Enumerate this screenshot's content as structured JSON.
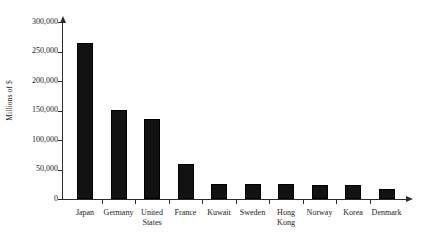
{
  "chart_data": {
    "type": "bar",
    "title": "",
    "xlabel": "",
    "ylabel": "Millions of $",
    "categories": [
      "Japan",
      "Germany",
      "United States",
      "France",
      "Kuwait",
      "Sweden",
      "Hong Kong",
      "Norway",
      "Korea",
      "Denmark"
    ],
    "values": [
      265000,
      151000,
      136000,
      60000,
      25000,
      25000,
      25000,
      24000,
      24000,
      17000
    ],
    "ylim": [
      0,
      300000
    ],
    "yticks": [
      0,
      50000,
      100000,
      150000,
      200000,
      250000,
      300000
    ],
    "ytick_labels": [
      "0",
      "50,000",
      "100,000",
      "150,000",
      "200,000",
      "250,000",
      "300,000"
    ],
    "grid": false,
    "legend": false,
    "bar_color": "#121212",
    "axis_color": "#2b2b2b"
  },
  "caption": ""
}
